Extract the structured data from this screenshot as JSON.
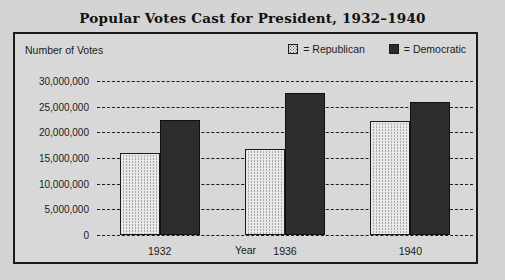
{
  "chart_data": {
    "type": "bar",
    "title": "Popular Votes Cast for President, 1932–1940",
    "xlabel": "Year",
    "ylabel": "Number of Votes",
    "categories": [
      "1932",
      "1936",
      "1940"
    ],
    "series": [
      {
        "name": "Republican",
        "values": [
          16000000,
          16700000,
          22300000
        ],
        "color": "#e8e8e8",
        "pattern": "stipple"
      },
      {
        "name": "Democratic",
        "values": [
          22500000,
          27600000,
          26000000
        ],
        "color": "#2d2d2d",
        "pattern": "solid"
      }
    ],
    "ylim": [
      0,
      30000000
    ],
    "ytick_values": [
      30000000,
      25000000,
      20000000,
      15000000,
      10000000,
      5000000,
      0
    ],
    "ytick_labels": [
      "30,000,000",
      "25,000,000",
      "20,000,000",
      "15,000,000",
      "10,000,000",
      "5,000,000",
      "0"
    ],
    "grid": "horizontal-dashed",
    "legend_position": "top-right",
    "legend_entries": [
      {
        "label": "= Republican",
        "swatch": "rep"
      },
      {
        "label": "= Democratic",
        "swatch": "dem"
      }
    ]
  },
  "colors": {
    "page_background": "#d2d2d2",
    "panel_background": "#d8d8d8",
    "frame": "#1a1a1a",
    "republican": "#e8e8e8",
    "democratic": "#2d2d2d"
  }
}
